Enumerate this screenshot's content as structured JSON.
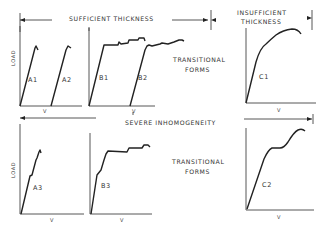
{
  "diagram": {
    "top_band": {
      "sufficient_label": "SUFFICIENT THICKNESS",
      "insufficient_label_line1": "INSUFFICIENT",
      "insufficient_label_line2": "THICKNESS"
    },
    "middle_band": {
      "severe_label": "SEVERE INHOMOGENEITY"
    },
    "transitional_top_line1": "TRANSITIONAL",
    "transitional_top_line2": "FORMS",
    "transitional_bottom_line1": "TRANSITIONAL",
    "transitional_bottom_line2": "FORMS",
    "y_axis_label_top": "LOAD",
    "y_axis_label_bottom": "LOAD",
    "x_axis_label": "V",
    "curves": {
      "A1": "A1",
      "A2": "A2",
      "B1": "B1",
      "B2": "B2",
      "C1": "C1",
      "A3": "A3",
      "B3": "B3",
      "C2": "C2"
    }
  }
}
